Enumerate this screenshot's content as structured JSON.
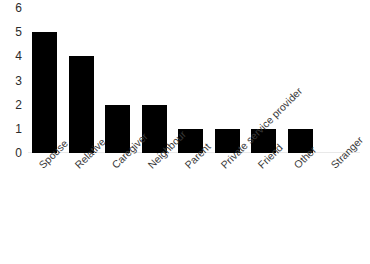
{
  "chart_data": {
    "type": "bar",
    "title": "",
    "subtitle": "",
    "xlabel": "",
    "ylabel": "",
    "categories": [
      "Spouse",
      "Relative",
      "Caregiver",
      "Neighbour",
      "Parent",
      "Private service provider",
      "Friend",
      "Other",
      "Stranger"
    ],
    "values": [
      5,
      4,
      2,
      2,
      1,
      1,
      1,
      1,
      0
    ],
    "ylim": [
      0,
      6
    ],
    "yticks": [
      0,
      1,
      2,
      3,
      4,
      5,
      6
    ],
    "ytick_labels": [
      "0",
      "1",
      "2",
      "3",
      "4",
      "5",
      "6"
    ],
    "grid": false,
    "legend": false,
    "legend_position": "none",
    "bar_color": "#000000",
    "background_color": "#ffffff",
    "axis_label_color": "#3a3a3a",
    "xtick_rotation": -45
  }
}
